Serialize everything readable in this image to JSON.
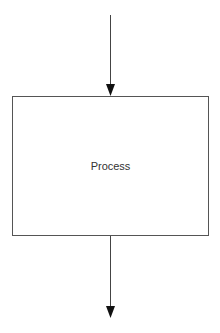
{
  "diagram": {
    "type": "flowchart",
    "nodes": [
      {
        "id": "process",
        "shape": "rectangle",
        "label": "Process"
      }
    ],
    "edges": [
      {
        "id": "incoming",
        "from": null,
        "to": "process",
        "direction": "down",
        "arrowhead": "filled"
      },
      {
        "id": "outgoing",
        "from": "process",
        "to": null,
        "direction": "down",
        "arrowhead": "filled"
      }
    ],
    "colors": {
      "stroke": "#555555",
      "arrow": "#111111",
      "text": "#333333",
      "background": "#ffffff"
    }
  }
}
